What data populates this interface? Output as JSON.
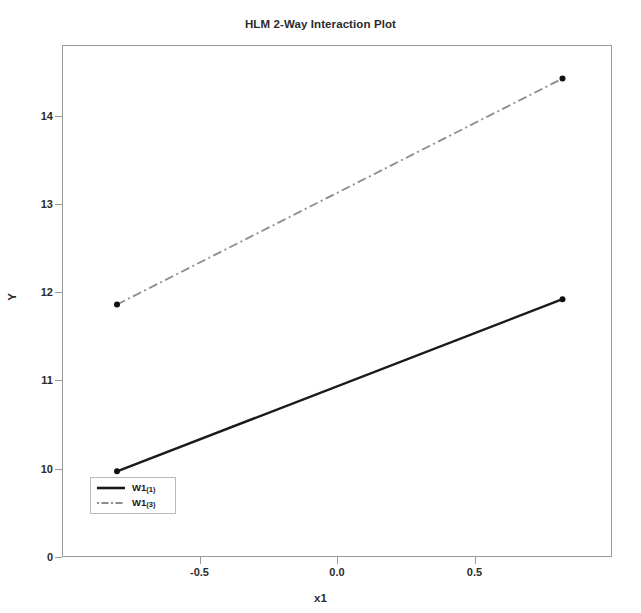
{
  "chart_data": {
    "type": "line",
    "title": "HLM 2-Way Interaction Plot",
    "xlabel": "x1",
    "ylabel": "Y",
    "grid": false,
    "legend_position": "lower-left-inside",
    "xlim": [
      -1.0,
      1.0
    ],
    "ylim": [
      9.0,
      14.8
    ],
    "xticks": [
      "-0.5",
      "0.0",
      "0.5"
    ],
    "xtick_values": [
      -0.5,
      0.0,
      0.5
    ],
    "yticks": [
      "0",
      "10",
      "11",
      "12",
      "13",
      "14"
    ],
    "ytick_values": [
      9.0,
      10,
      11,
      12,
      13,
      14
    ],
    "x": [
      -0.8,
      0.82
    ],
    "series": [
      {
        "name": "W1(1)",
        "label_main": "W1",
        "label_sub": "(1)",
        "values": [
          9.97,
          11.92
        ],
        "style": "solid",
        "color": "#1a1a1a",
        "width": 2.4,
        "markers": true
      },
      {
        "name": "W1(3)",
        "label_main": "W1",
        "label_sub": "(3)",
        "values": [
          11.86,
          14.42
        ],
        "style": "dashdot",
        "color": "#8c8c8c",
        "width": 1.8,
        "markers": true
      }
    ]
  },
  "figure": {
    "frame_color": "#9a9a9a",
    "background": "#ffffff",
    "text_color": "#2b2b2b"
  }
}
